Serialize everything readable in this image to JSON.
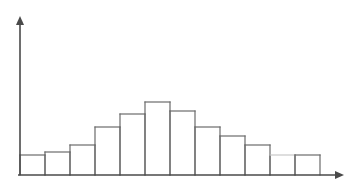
{
  "canvas": {
    "width": 356,
    "height": 186,
    "background": "#ffffff"
  },
  "chart_data": {
    "type": "bar",
    "title": "",
    "subtitle": "",
    "xlabel": "",
    "ylabel": "",
    "grid": false,
    "legend": null,
    "legend_position": "none",
    "annotations": [],
    "categories": [
      "1",
      "2",
      "3",
      "4",
      "5",
      "6",
      "7",
      "8",
      "9",
      "10",
      "11",
      "12"
    ],
    "tick_labels": [],
    "values": [
      20,
      23,
      30,
      48,
      61,
      73,
      64,
      48,
      39,
      30,
      20,
      20
    ],
    "value_units": "pixels-above-baseline",
    "ylim": [
      0,
      73
    ],
    "xlim": [
      0,
      12
    ],
    "bar_geometry": {
      "baseline_y": 175,
      "first_bar_left_x": 20,
      "bar_width": 25,
      "bars": [
        {
          "index": 1,
          "x": 20,
          "top_y": 155,
          "height": 20,
          "faint_top": false
        },
        {
          "index": 2,
          "x": 45,
          "top_y": 152,
          "height": 23,
          "faint_top": false
        },
        {
          "index": 3,
          "x": 70,
          "top_y": 145,
          "height": 30,
          "faint_top": false
        },
        {
          "index": 4,
          "x": 95,
          "top_y": 127,
          "height": 48,
          "faint_top": false
        },
        {
          "index": 5,
          "x": 120,
          "top_y": 114,
          "height": 61,
          "faint_top": false
        },
        {
          "index": 6,
          "x": 145,
          "top_y": 102,
          "height": 73,
          "faint_top": false
        },
        {
          "index": 7,
          "x": 170,
          "top_y": 111,
          "height": 64,
          "faint_top": false
        },
        {
          "index": 8,
          "x": 195,
          "top_y": 127,
          "height": 48,
          "faint_top": false
        },
        {
          "index": 9,
          "x": 220,
          "top_y": 136,
          "height": 39,
          "faint_top": false
        },
        {
          "index": 10,
          "x": 245,
          "top_y": 145,
          "height": 30,
          "faint_top": false
        },
        {
          "index": 11,
          "x": 270,
          "top_y": 155,
          "height": 20,
          "faint_top": true
        },
        {
          "index": 12,
          "x": 295,
          "top_y": 155,
          "height": 20,
          "faint_top": false
        }
      ]
    },
    "axes": {
      "y_axis": {
        "x": 20,
        "y_top": 16,
        "y_bottom": 175,
        "has_arrow": true,
        "arrow_at": "top"
      },
      "x_axis": {
        "y": 175,
        "x_left": 20,
        "x_right": 344,
        "has_arrow": true,
        "arrow_at": "right"
      }
    },
    "style": {
      "bar_stroke": "#6b6b6b",
      "bar_stroke_faint": "#c9c9c9",
      "bar_fill": "#ffffff",
      "bar_stroke_width": 1.2,
      "axis_color": "#4a4a4a",
      "axis_stroke_width": 1.6
    }
  }
}
